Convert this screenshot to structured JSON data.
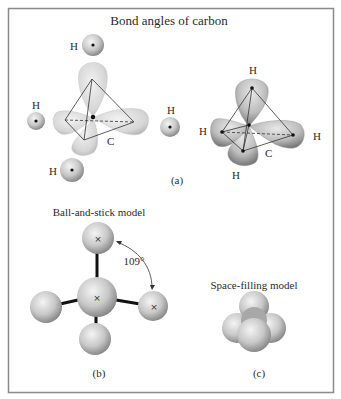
{
  "figure": {
    "title": "Bond angles of carbon",
    "panels": {
      "a": {
        "label": "(a)",
        "left": {
          "carbon_label": "C",
          "hydrogen_labels": [
            "H",
            "H",
            "H",
            "H"
          ]
        },
        "right": {
          "carbon_label": "C",
          "hydrogen_labels": [
            "H",
            "H",
            "H",
            "H"
          ]
        }
      },
      "b": {
        "label": "(b)",
        "title": "Ball-and-stick model",
        "angle_label": "109°",
        "atom_marker": "×"
      },
      "c": {
        "label": "(c)",
        "title": "Space-filling model"
      }
    },
    "colors": {
      "frame": "#8a8a8a",
      "orbital": "#d9d9d9",
      "sphere_light": "#f0f0f0",
      "sphere_dark": "#8c8c8c",
      "line": "#333333"
    }
  }
}
